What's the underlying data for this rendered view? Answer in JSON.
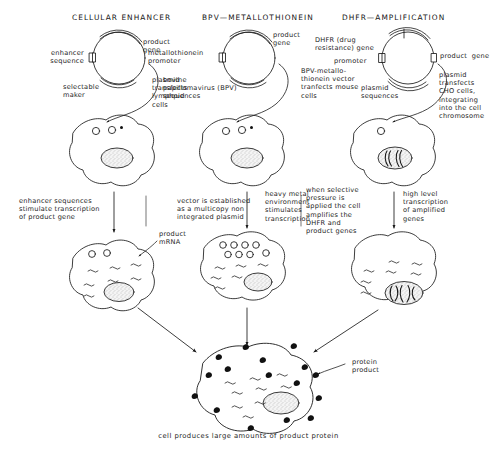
{
  "figure": {
    "caption": "cell produces large amounts of product protein",
    "columns": [
      {
        "id": "cellular-enhancer",
        "header": "CELLULAR ENHANCER",
        "plasmid_labels": {
          "left": "enhancer\nsequence",
          "right_top": "product\ngene",
          "bottom": "selectable\nmaker",
          "transfect": "plasmid\ntransfects\nlymphoid\ncells"
        },
        "step_label": "enhancer sequences\nstimulate transcription\nof product gene",
        "mrna_label": "product\nmRNA"
      },
      {
        "id": "bpv-metallothionein",
        "header": "BPV—METALLOTHIONEIN",
        "plasmid_labels": {
          "left": "metallothionein\npromoter",
          "right_top": "product\ngene",
          "bottom": "bovine\npapillomavirus (BPV)\nsequences",
          "transfect": "BPV-metallo-\nthionein vector\ntranfects mouse\ncells"
        },
        "step_label": "vector is established\nas a multicopy non\nintegrated plasmid",
        "step_label_2": "heavy metal\nenvironment\nstimulates\ntranscription"
      },
      {
        "id": "dhfr-amplification",
        "header": "DHFR—AMPLIFICATION",
        "plasmid_labels": {
          "left_top": "DHFR (drug\nresistance) gene",
          "left_bottom": "promoter",
          "right_top": "product  gene",
          "bottom": "plasmid\nsequences",
          "transfect": "plasmid\ntransfects\nCHO cells,\nintegrating\ninto the cell\nchromosome"
        },
        "step_label": "when selective\npressure is\napplied the cell\namplifies the\nDHFR and\nproduct genes",
        "step_label_2": "high level\ntranscription\nof amplified\ngenes"
      }
    ],
    "protein_label": "protein\nproduct",
    "colors": {
      "ink": "#1a1a1a",
      "background": "#ffffff",
      "nucleus_fill": "#f2f2f2",
      "protein_fill": "#111111"
    }
  }
}
